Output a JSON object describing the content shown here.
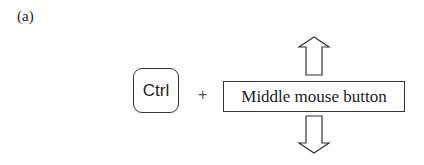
{
  "figure_label": "(a)",
  "key": {
    "label": "Ctrl"
  },
  "operator": "+",
  "mouse_action": {
    "label": "Middle mouse button"
  },
  "arrows": [
    {
      "direction": "up",
      "icon": "arrow-up-outline-icon"
    },
    {
      "direction": "down",
      "icon": "arrow-down-outline-icon"
    }
  ],
  "colors": {
    "stroke": "#333333",
    "background": "#ffffff"
  }
}
